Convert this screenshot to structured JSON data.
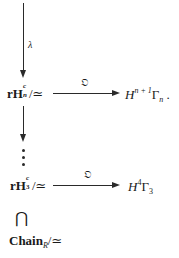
{
  "diagram": {
    "arrows": [
      {
        "id": "lambda-arrow",
        "direction": "down",
        "label": "λ"
      },
      {
        "id": "top-horizontal",
        "direction": "right",
        "label": "𝔒"
      },
      {
        "id": "middle-vertical",
        "direction": "down",
        "label": ""
      },
      {
        "id": "bottom-horizontal",
        "direction": "right",
        "label": "𝔒"
      }
    ],
    "nodes": {
      "top_left": {
        "main": "rH",
        "sup": "c",
        "sub": "n",
        "suffix": "/≃"
      },
      "top_right": {
        "main": "H",
        "sup": "n + 1",
        "greek": "Γ",
        "sub": "n",
        "suffix": " ."
      },
      "bottom_left": {
        "main": "rH",
        "sup": "c",
        "sub": "3",
        "suffix": "/≃"
      },
      "bottom_right": {
        "main": "H",
        "sup": "4",
        "greek": "Γ",
        "sub": "3",
        "suffix": ""
      },
      "inclusion": {
        "symbol": "⋂"
      },
      "chain": {
        "main": "Chain",
        "sub": "R",
        "suffix": "/≃"
      }
    },
    "ellipsis": "⋮"
  }
}
